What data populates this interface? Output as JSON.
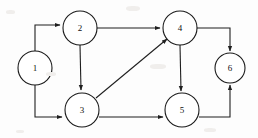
{
  "figure": {
    "width": 258,
    "height": 138,
    "background_color": "#fdfdfd",
    "stroke_color": "#1f1f1f",
    "node_fill_color": "#ffffff",
    "label_color": "#111111",
    "node_radius": 17
  },
  "chart_data": {
    "type": "diagram",
    "subtype": "directed-graph",
    "nodes": [
      {
        "id": "1",
        "label": "1",
        "cx": 35,
        "cy": 68,
        "r": 17
      },
      {
        "id": "2",
        "label": "2",
        "cx": 80,
        "cy": 28,
        "r": 17
      },
      {
        "id": "3",
        "label": "3",
        "cx": 82,
        "cy": 110,
        "r": 17
      },
      {
        "id": "4",
        "label": "4",
        "cx": 180,
        "cy": 28,
        "r": 17
      },
      {
        "id": "5",
        "label": "5",
        "cx": 182,
        "cy": 110,
        "r": 17
      },
      {
        "id": "6",
        "label": "6",
        "cx": 230,
        "cy": 68,
        "r": 15
      }
    ],
    "edges": [
      {
        "id": "e1-2",
        "from": "1",
        "to": "2",
        "shape": "orthogonal",
        "directed": true
      },
      {
        "id": "e1-3",
        "from": "1",
        "to": "3",
        "shape": "orthogonal",
        "directed": true
      },
      {
        "id": "e2-4",
        "from": "2",
        "to": "4",
        "shape": "straight",
        "directed": true
      },
      {
        "id": "e2-3",
        "from": "2",
        "to": "3",
        "shape": "straight",
        "directed": true
      },
      {
        "id": "e3-4",
        "from": "3",
        "to": "4",
        "shape": "diagonal",
        "directed": true
      },
      {
        "id": "e3-5",
        "from": "3",
        "to": "5",
        "shape": "straight",
        "directed": true
      },
      {
        "id": "e4-5",
        "from": "4",
        "to": "5",
        "shape": "straight",
        "directed": true
      },
      {
        "id": "e4-6",
        "from": "4",
        "to": "6",
        "shape": "orthogonal",
        "directed": true
      },
      {
        "id": "e5-6",
        "from": "5",
        "to": "6",
        "shape": "orthogonal",
        "directed": true
      }
    ],
    "edge_paths": {
      "e1-2": "M 35 51 L 35 25 L 60 25",
      "e1-3": "M 35 85 L 35 117 L 62 117",
      "e2-4": "M 97 28 L 160 28",
      "e2-3": "M 80 45 L 81 90",
      "e3-4": "M 96 98 L 167 39",
      "e3-5": "M 99 117 L 163 117",
      "e4-5": "M 180 45 L 181 91",
      "e4-6": "M 197 28 L 230 28 L 230 51",
      "e5-6": "M 199 117 L 230 117 L 230 85"
    },
    "arrowheads": [
      {
        "edge": "e1-2",
        "x": 60,
        "y": 25,
        "angle": 0
      },
      {
        "edge": "e1-3",
        "x": 62,
        "y": 117,
        "angle": 0
      },
      {
        "edge": "e2-4",
        "x": 160,
        "y": 28,
        "angle": 0
      },
      {
        "edge": "e2-3",
        "x": 81,
        "y": 91,
        "angle": 90
      },
      {
        "edge": "e3-4",
        "x": 167,
        "y": 39,
        "angle": -39.7
      },
      {
        "edge": "e3-5",
        "x": 163,
        "y": 117,
        "angle": 0
      },
      {
        "edge": "e4-5",
        "x": 181,
        "y": 92,
        "angle": 90
      },
      {
        "edge": "e4-6",
        "x": 230,
        "y": 51,
        "angle": 90
      },
      {
        "edge": "e5-6",
        "x": 230,
        "y": 85,
        "angle": -90
      }
    ]
  }
}
